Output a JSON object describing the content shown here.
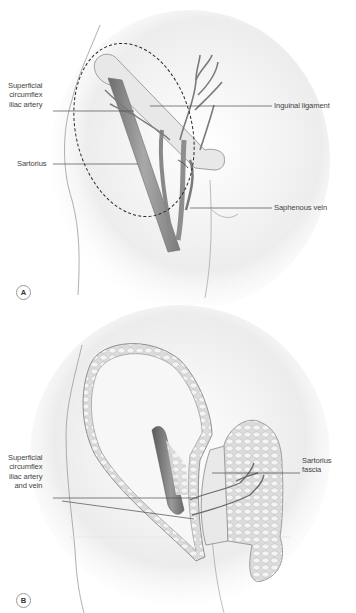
{
  "figure": {
    "panels": [
      {
        "id": "A",
        "badge": "A",
        "labels": {
          "superficial_circumflex": [
            "Superficial",
            "circumflex",
            "iliac artery"
          ],
          "sartorius": "Sartorius",
          "inguinal_ligament": "Inguinal ligament",
          "saphenous_vein": "Saphenous vein"
        }
      },
      {
        "id": "B",
        "badge": "B",
        "labels": {
          "superficial_circumflex_av": [
            "Superficial",
            "circumflex",
            "iliac artery",
            "and vein"
          ],
          "sartorius_fascia": [
            "Sartorius",
            "fascia"
          ]
        }
      }
    ],
    "colors": {
      "skin_shade": "#d9d9d9",
      "muscle": "#8c8c8c",
      "vessel": "#7a7a7a",
      "leader_line": "#4a4a4a",
      "dashed_outline": "#2a2a2a"
    }
  }
}
